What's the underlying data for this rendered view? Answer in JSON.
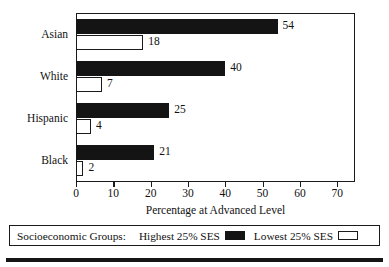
{
  "chart_data": {
    "type": "bar",
    "orientation": "horizontal",
    "title": "",
    "xlabel": "Percentage at Advanced Level",
    "ylabel": "",
    "xlim": [
      0,
      74.5
    ],
    "xticks": [
      0,
      10,
      20,
      30,
      40,
      50,
      60,
      70
    ],
    "xticklabels": [
      "0",
      "10",
      "20",
      "30",
      "40",
      "50",
      "60",
      "70"
    ],
    "grid": false,
    "legend_position": "below-plot",
    "categories": [
      "Asian",
      "White",
      "Hispanic",
      "Black"
    ],
    "series": [
      {
        "name": "Highest 25% SES",
        "color": "#141414",
        "values": [
          54,
          40,
          25,
          21
        ],
        "value_labels": [
          "54",
          "40",
          "25",
          "21"
        ]
      },
      {
        "name": "Lowest 25% SES",
        "color": "#ffffff",
        "values": [
          18,
          7,
          4,
          2
        ],
        "value_labels": [
          "18",
          "7",
          "4",
          "2"
        ]
      }
    ]
  },
  "legend": {
    "title": "Socioeconomic Groups:",
    "entries": [
      {
        "label": "Highest 25% SES",
        "swatch": "black-swatch"
      },
      {
        "label": "Lowest 25% SES",
        "swatch": "white-swatch"
      }
    ]
  },
  "axis": {
    "x_title": "Percentage at Advanced Level"
  }
}
